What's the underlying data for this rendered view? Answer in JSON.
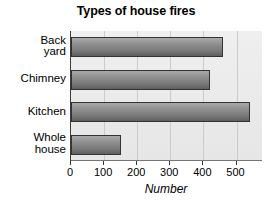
{
  "chart_data": {
    "type": "bar",
    "orientation": "horizontal",
    "title": "Types of house fires",
    "xlabel": "Number",
    "ylabel": "",
    "categories": [
      "Back yard",
      "Chimney",
      "Kitchen",
      "Whole house"
    ],
    "category_lines": [
      [
        "Back",
        "yard"
      ],
      [
        "Chimney"
      ],
      [
        "Kitchen"
      ],
      [
        "Whole",
        "house"
      ]
    ],
    "values": [
      460,
      420,
      540,
      150
    ],
    "xlim": [
      0,
      580
    ],
    "xticks": [
      0,
      100,
      200,
      300,
      400,
      500
    ],
    "xtick_labels": [
      "0",
      "100",
      "200",
      "300",
      "400",
      "500"
    ],
    "grid": "vertical",
    "legend": "none",
    "bar_color_top": "#a9a9a9",
    "bar_color_bottom": "#5e5e5e",
    "bar_border_color": "#333333",
    "plot_background": "#e2e2e2",
    "axis_color": "#3a3a3a"
  }
}
